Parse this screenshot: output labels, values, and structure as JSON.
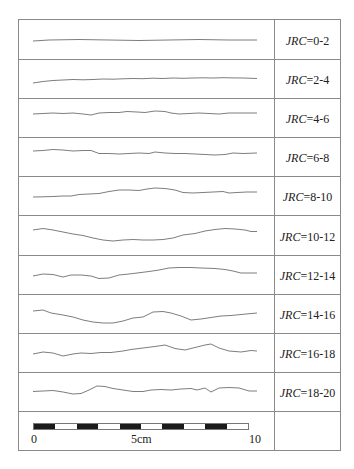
{
  "figure": {
    "rows": [
      {
        "label_prefix": "JRC",
        "label_suffix": "=0-2",
        "points": "14,21 30,20 60,19.5 90,20 120,20.5 150,20 180,19.5 210,20 238,20"
      },
      {
        "label_prefix": "JRC",
        "label_suffix": "=2-4",
        "points": "14,23 24,21.5 34,20.5 44,20 54,19.5 64,19.8 74,19.5 84,19 94,19.2 104,18.8 114,18.5 124,18.7 134,18.2 144,18.5 154,18 164,18.3 174,18 184,17.8 194,18 204,17.7 214,17.9 224,18 238,18.5"
      },
      {
        "label_prefix": "JRC",
        "label_suffix": "=4-6",
        "points": "14,15 24,14.5 34,14 44,14.5 54,14 64,15 72,16 80,14 90,13.5 100,13.5 108,12.5 118,13 126,13.5 136,12 146,12.5 152,14 160,15 170,14.5 180,14 190,14.5 200,15 210,14 220,14 238,14"
      },
      {
        "label_prefix": "JRC",
        "label_suffix": "=6-8",
        "points": "14,13 24,12.5 34,11.5 44,12 54,13 64,12.5 72,12.5 80,15.5 90,15.5 100,16 110,15.5 120,15 130,15.5 136,14 146,15 156,15.5 166,15.5 176,16 186,16.5 196,17 206,16.5 214,15 224,15.5 238,15"
      },
      {
        "label_prefix": "JRC",
        "label_suffix": "=8-10",
        "points": "14,20 24,19.8 34,19.5 44,19 52,19 60,17.5 70,17 80,16.5 90,14.5 100,13 110,13 120,13.5 128,12 136,11 146,11.5 156,13 164,15.5 174,16 184,15.5 194,15 204,14.5 210,16 218,15.5 228,15 238,15"
      },
      {
        "label_prefix": "JRC",
        "label_suffix": "=10-12",
        "points": "14,14 24,12.5 34,14 44,16 54,18 64,19.5 74,22 84,24 94,25 104,24 114,23.5 124,24 134,24 144,23.5 154,22 164,19 176,17.5 186,15 196,13.5 206,12.5 216,13 226,14 232,15.5 238,15.5"
      },
      {
        "label_prefix": "JRC",
        "label_suffix": "=12-14",
        "points": "14,20 24,18 34,18.5 44,21 52,19 62,19 72,20 80,22.5 90,22 100,19 110,18 118,17 130,15.5 140,14 150,12 160,11.5 172,11.5 182,12 196,12.5 206,13.5 214,15 222,17 238,17"
      },
      {
        "label_prefix": "JRC",
        "label_suffix": "=14-16",
        "points": "14,16 24,15 32,18 44,20 54,22 64,25 74,27 84,28 94,28 104,26 114,23 124,22 134,17 144,16.5 152,18 162,21 172,25 182,24 192,22.5 202,21 212,20.5 222,19.5 238,18"
      },
      {
        "label_prefix": "JRC",
        "label_suffix": "=16-18",
        "points": "14,20 24,18 34,19 44,22 54,20 62,19 72,19.5 82,18.5 92,18.5 104,17 112,15.5 124,14 136,12.5 146,11 156,14.5 166,16 176,13.5 186,11 192,10 200,14 210,17 222,18 232,16.5 238,17"
      },
      {
        "label_prefix": "JRC",
        "label_suffix": "=18-20",
        "points": "14,18.5 24,18 34,17.5 44,19 54,21 62,20.5 70,17 78,13 86,13.5 94,15.5 104,17 114,18.5 124,18.5 132,17 142,16.5 152,17 162,16 172,15.5 178,17 186,15 192,19 200,15 210,14.5 220,15 230,18 238,18"
      }
    ],
    "scale": {
      "segments": [
        "black",
        "white",
        "black",
        "white",
        "black",
        "white",
        "black",
        "white",
        "black",
        "white"
      ],
      "label_start": "0",
      "label_mid": "5cm",
      "label_end": "10"
    },
    "colors": {
      "line": "#6e6e6e",
      "border": "#8a8a8a",
      "scale_black": "#1b1b1b"
    }
  }
}
